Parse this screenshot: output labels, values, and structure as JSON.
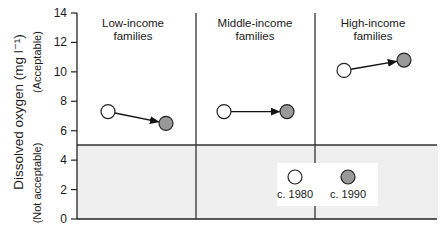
{
  "chart_data": {
    "type": "scatter",
    "title": "",
    "xlabel": "",
    "ylabel": "Dissolved oxygen (mg l⁻¹)",
    "ylim": [
      0,
      14
    ],
    "yticks": [
      0,
      2,
      4,
      6,
      8,
      10,
      12,
      14
    ],
    "grid": false,
    "panels": [
      {
        "title_line1": "Low-income",
        "title_line2": "families"
      },
      {
        "title_line1": "Middle-income",
        "title_line2": "families"
      },
      {
        "title_line1": "High-income",
        "title_line2": "families"
      }
    ],
    "categories": [
      "Low-income families",
      "Middle-income families",
      "High-income families"
    ],
    "series": [
      {
        "name": "c. 1980",
        "marker": "open-circle",
        "values": [
          7.3,
          7.3,
          10.1
        ]
      },
      {
        "name": "c. 1990",
        "marker": "filled-circle",
        "color": "#999999",
        "values": [
          6.5,
          7.3,
          10.8
        ]
      }
    ],
    "annotations": {
      "acceptable_label": "(Acceptable)",
      "not_acceptable_label": "(Not acceptable)",
      "threshold_value": 5,
      "threshold_shading": "#efefef"
    },
    "legend": {
      "position": "lower-right inside plot",
      "entries": [
        "c. 1980",
        "c. 1990"
      ]
    }
  }
}
